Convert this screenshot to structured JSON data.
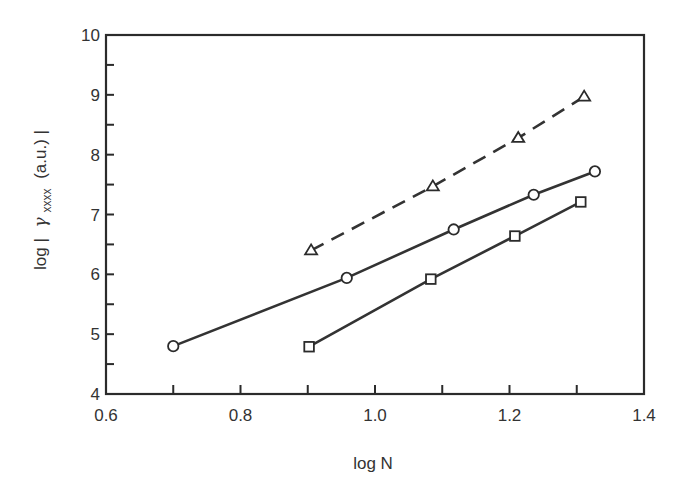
{
  "chart_data": {
    "type": "line",
    "title": "",
    "xlabel": "log  N",
    "ylabel": "log  | γxxxx (a.u.) |",
    "ylabel_parts": {
      "prefix": "log  |",
      "symbol": "γ",
      "subscript": "xxxx",
      "suffix": "(a.u.) |"
    },
    "xlim": [
      0.6,
      1.4
    ],
    "ylim": [
      4,
      10
    ],
    "x_ticks": [
      0.6,
      0.7,
      0.8,
      0.9,
      1.0,
      1.1,
      1.2,
      1.3,
      1.4
    ],
    "x_tick_labels": [
      "0.6",
      "0.8",
      "1.0",
      "1.2",
      "1.4"
    ],
    "x_tick_label_values": [
      0.6,
      0.8,
      1.0,
      1.2,
      1.4
    ],
    "y_ticks": [
      4,
      4.5,
      5,
      5.5,
      6,
      6.5,
      7,
      7.5,
      8,
      8.5,
      9,
      9.5,
      10
    ],
    "y_tick_labels": [
      "4",
      "5",
      "6",
      "7",
      "8",
      "9",
      "10"
    ],
    "y_tick_label_values": [
      4,
      5,
      6,
      7,
      8,
      9,
      10
    ],
    "grid": false,
    "legend": null,
    "series": [
      {
        "name": "triangles (dashed)",
        "marker": "triangle",
        "line_style": "dashed",
        "x": [
          0.905,
          1.086,
          1.213,
          1.311
        ],
        "y": [
          6.4,
          7.47,
          8.28,
          8.97
        ]
      },
      {
        "name": "circles (solid)",
        "marker": "circle",
        "line_style": "solid",
        "x": [
          0.7,
          0.958,
          1.117,
          1.236,
          1.327
        ],
        "y": [
          4.8,
          5.94,
          6.75,
          7.33,
          7.72
        ]
      },
      {
        "name": "squares (solid)",
        "marker": "square",
        "line_style": "solid",
        "x": [
          0.902,
          1.083,
          1.208,
          1.306
        ],
        "y": [
          4.79,
          5.92,
          6.64,
          7.21
        ]
      }
    ]
  }
}
